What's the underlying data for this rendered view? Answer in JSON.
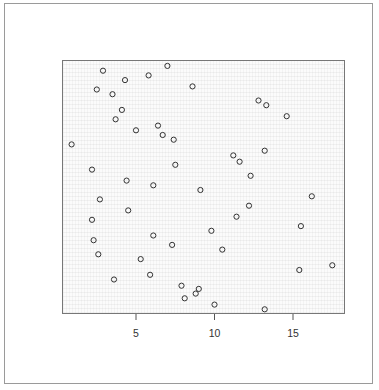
{
  "chart_data": {
    "type": "scatter",
    "title": "",
    "xlabel": "",
    "ylabel": "",
    "x_ticks": [
      5,
      10,
      15
    ],
    "y_ticks": [],
    "xlim": [
      0.4,
      18.4
    ],
    "ylim": [
      0,
      16.2
    ],
    "grid": false,
    "legend": null,
    "marker": "open-circle",
    "marker_color": "#333333",
    "points": [
      {
        "x": 2.9,
        "y": 15.5
      },
      {
        "x": 4.3,
        "y": 14.9
      },
      {
        "x": 2.5,
        "y": 14.3
      },
      {
        "x": 3.5,
        "y": 14.0
      },
      {
        "x": 4.1,
        "y": 13.0
      },
      {
        "x": 3.7,
        "y": 12.4
      },
      {
        "x": 5.0,
        "y": 11.7
      },
      {
        "x": 5.8,
        "y": 15.2
      },
      {
        "x": 7.0,
        "y": 15.8
      },
      {
        "x": 8.6,
        "y": 14.5
      },
      {
        "x": 6.4,
        "y": 12.0
      },
      {
        "x": 6.7,
        "y": 11.4
      },
      {
        "x": 7.4,
        "y": 11.1
      },
      {
        "x": 12.8,
        "y": 13.6
      },
      {
        "x": 13.3,
        "y": 13.3
      },
      {
        "x": 14.6,
        "y": 12.6
      },
      {
        "x": 0.9,
        "y": 10.8
      },
      {
        "x": 11.2,
        "y": 10.1
      },
      {
        "x": 11.6,
        "y": 9.7
      },
      {
        "x": 13.2,
        "y": 10.4
      },
      {
        "x": 2.2,
        "y": 9.2
      },
      {
        "x": 7.5,
        "y": 9.5
      },
      {
        "x": 12.3,
        "y": 8.8
      },
      {
        "x": 4.4,
        "y": 8.5
      },
      {
        "x": 6.1,
        "y": 8.2
      },
      {
        "x": 9.1,
        "y": 7.9
      },
      {
        "x": 2.7,
        "y": 7.3
      },
      {
        "x": 16.2,
        "y": 7.5
      },
      {
        "x": 12.2,
        "y": 6.9
      },
      {
        "x": 4.5,
        "y": 6.6
      },
      {
        "x": 11.4,
        "y": 6.2
      },
      {
        "x": 2.2,
        "y": 6.0
      },
      {
        "x": 15.5,
        "y": 5.6
      },
      {
        "x": 9.8,
        "y": 5.3
      },
      {
        "x": 6.1,
        "y": 5.0
      },
      {
        "x": 2.3,
        "y": 4.7
      },
      {
        "x": 7.3,
        "y": 4.4
      },
      {
        "x": 10.5,
        "y": 4.1
      },
      {
        "x": 2.6,
        "y": 3.8
      },
      {
        "x": 5.3,
        "y": 3.5
      },
      {
        "x": 17.5,
        "y": 3.1
      },
      {
        "x": 15.4,
        "y": 2.8
      },
      {
        "x": 5.9,
        "y": 2.5
      },
      {
        "x": 3.6,
        "y": 2.2
      },
      {
        "x": 7.9,
        "y": 1.8
      },
      {
        "x": 9.0,
        "y": 1.6
      },
      {
        "x": 8.8,
        "y": 1.3
      },
      {
        "x": 8.1,
        "y": 1.0
      },
      {
        "x": 10.0,
        "y": 0.6
      },
      {
        "x": 13.2,
        "y": 0.3
      }
    ]
  },
  "axis": {
    "x_tick_labels": [
      "5",
      "10",
      "15"
    ]
  }
}
